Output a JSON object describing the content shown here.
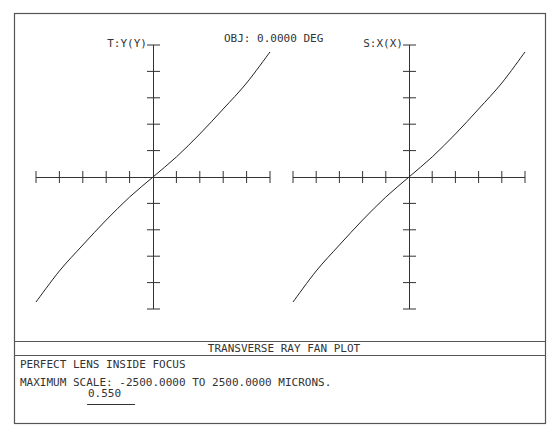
{
  "window": {
    "footer_title": "TRANSVERSE RAY FAN PLOT",
    "description_line1": "PERFECT LENS INSIDE FOCUS",
    "description_line2": "MAXIMUM SCALE: -2500.0000 TO 2500.0000 MICRONS.",
    "wavelength_label": "0.550"
  },
  "chart_data": [
    {
      "type": "line",
      "title": "OBJ: 0.0000 DEG",
      "ylabel": "T:Y(Y)",
      "xlabel": "",
      "xlim": [
        -1,
        1
      ],
      "ylim": [
        -2500,
        2500
      ],
      "x_ticks": 10,
      "y_ticks": 10,
      "grid": false,
      "series": [
        {
          "name": "0.550",
          "x": [
            -1.0,
            -0.8,
            -0.6,
            -0.4,
            -0.2,
            0.0,
            0.2,
            0.4,
            0.6,
            0.8,
            1.0
          ],
          "values": [
            -2368,
            -1780,
            -1288,
            -815,
            -380,
            0,
            380,
            815,
            1288,
            1780,
            2368
          ]
        }
      ]
    },
    {
      "type": "line",
      "title": "OBJ: 0.0000 DEG",
      "ylabel": "S:X(X)",
      "xlabel": "",
      "xlim": [
        -1,
        1
      ],
      "ylim": [
        -2500,
        2500
      ],
      "x_ticks": 10,
      "y_ticks": 10,
      "grid": false,
      "series": [
        {
          "name": "0.550",
          "x": [
            -1.0,
            -0.8,
            -0.6,
            -0.4,
            -0.2,
            0.0,
            0.2,
            0.4,
            0.6,
            0.8,
            1.0
          ],
          "values": [
            -2368,
            -1780,
            -1288,
            -815,
            -380,
            0,
            380,
            815,
            1288,
            1780,
            2368
          ]
        }
      ]
    }
  ]
}
